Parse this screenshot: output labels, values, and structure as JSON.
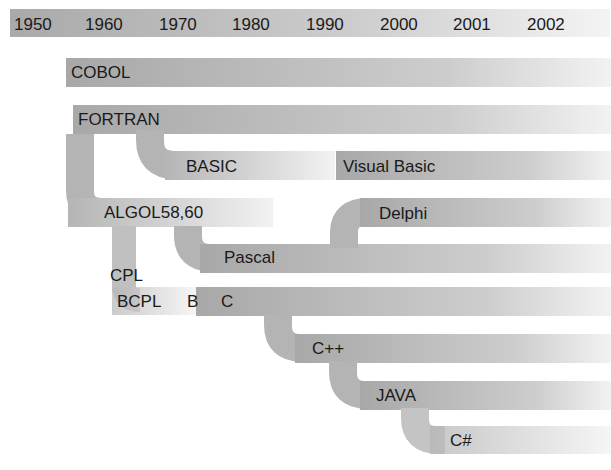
{
  "diagram": {
    "type": "timeline-tree",
    "timeline": {
      "years": [
        "1950",
        "1960",
        "1970",
        "1980",
        "1990",
        "2000",
        "2001",
        "2002"
      ]
    },
    "languages": [
      {
        "id": "cobol",
        "label": "COBOL"
      },
      {
        "id": "fortran",
        "label": "FORTRAN"
      },
      {
        "id": "basic",
        "label": "BASIC",
        "parent": "fortran"
      },
      {
        "id": "visual-basic",
        "label": "Visual Basic",
        "parent": "basic"
      },
      {
        "id": "algol",
        "label": "ALGOL58,60",
        "parent": "fortran"
      },
      {
        "id": "pascal",
        "label": "Pascal",
        "parent": "algol"
      },
      {
        "id": "delphi",
        "label": "Delphi",
        "parent": "pascal"
      },
      {
        "id": "cpl",
        "label": "CPL",
        "parent": "algol"
      },
      {
        "id": "bcpl",
        "label": "BCPL",
        "parent": "cpl"
      },
      {
        "id": "b",
        "label": "B",
        "parent": "bcpl"
      },
      {
        "id": "c",
        "label": "C",
        "parent": "b"
      },
      {
        "id": "cpp",
        "label": "C++",
        "parent": "c"
      },
      {
        "id": "java",
        "label": "JAVA",
        "parent": "cpp"
      },
      {
        "id": "csharp",
        "label": "C#",
        "parent": "java"
      }
    ]
  }
}
